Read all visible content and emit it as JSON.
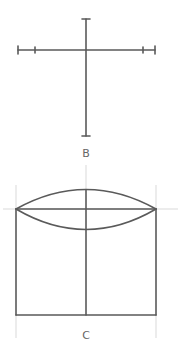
{
  "figures": [
    {
      "id": "B",
      "label": "B",
      "description": "Cross with measured horizontal and vertical axes"
    },
    {
      "id": "C",
      "label": "C",
      "description": "Cylinder construction: ellipse top over rectangle body with center axis"
    }
  ],
  "colors": {
    "line": "#5a5a5a",
    "guide": "#d9d9d9",
    "label": "#666666",
    "background": "#ffffff"
  }
}
